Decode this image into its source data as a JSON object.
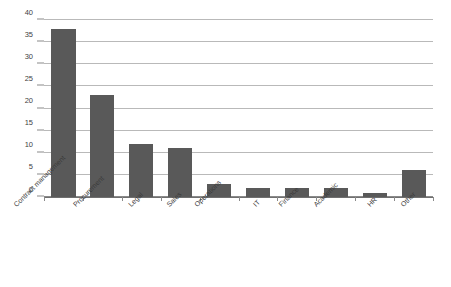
{
  "chart_data": {
    "type": "bar",
    "title": "",
    "subtitle": "",
    "xlabel": "",
    "ylabel": "",
    "ylim": [
      0,
      40
    ],
    "yticks": [
      0,
      5,
      10,
      15,
      20,
      25,
      30,
      35,
      40
    ],
    "ytick_labels": [
      "0",
      "5",
      "10",
      "15",
      "20",
      "25",
      "30",
      "35",
      "40"
    ],
    "grid": "horizontal",
    "legend": "none",
    "orientation": "vertical",
    "bar_color": "#595959",
    "gridline_color": "#b9b9b9",
    "axis_color": "#6f6f6f",
    "categories": [
      "Contract management",
      "Procurement",
      "Legal",
      "Sales",
      "Operations",
      "IT",
      "Finance",
      "Academic",
      "HR",
      "Other"
    ],
    "values": [
      38,
      23,
      12,
      11,
      3,
      2,
      2,
      2,
      1,
      6
    ],
    "series": [
      {
        "name": "Count",
        "values": [
          38,
          23,
          12,
          11,
          3,
          2,
          2,
          2,
          1,
          6
        ]
      }
    ]
  }
}
